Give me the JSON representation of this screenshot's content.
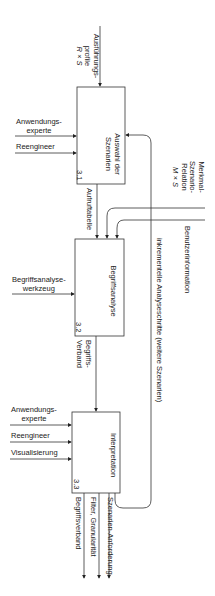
{
  "diagram": {
    "type": "IDEF0 activity diagram (rotated 90°)",
    "boxes": [
      {
        "id": "3.1",
        "title_line1": "Auswahl der",
        "title_line2": "Szenarien"
      },
      {
        "id": "3.2",
        "title": "Begriffsanalyse"
      },
      {
        "id": "3.3",
        "title": "Interpretation"
      }
    ],
    "inputs_top": {
      "profiles_l1": "Ausführungs-",
      "profiles_l2": "profile",
      "profiles_l3": "R × S",
      "relation_l1": "Merkmal-",
      "relation_l2": "Szenario-",
      "relation_l3": "Relation",
      "relation_l4": "M × S",
      "user_info": "Benutzerinformation",
      "feedback": "inkrementelle Analyseschritte (weitere Szenarien)"
    },
    "mechanisms": {
      "box1": [
        "Anwendungs-",
        "experte",
        "Reengineer"
      ],
      "box2": [
        "Begriffsanalyse-",
        "werkzeug"
      ],
      "box3": [
        "Anwendungs-",
        "experte",
        "Reengineer",
        "Visualisierung"
      ]
    },
    "flows": {
      "box1_out": "Aufruftabelle",
      "box2_out_l1": "Begriffs-",
      "box2_out_l2": "Verband",
      "box3_out1": "Begriffsverband",
      "box3_out2": "Filter, Granularität",
      "box3_out3": "Szenarien-Anforderung"
    }
  }
}
